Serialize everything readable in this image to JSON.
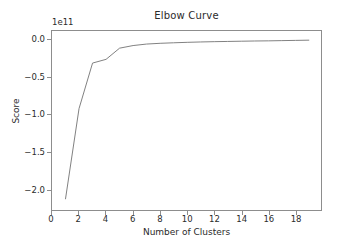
{
  "chart_data": {
    "type": "line",
    "title": "Elbow Curve",
    "xlabel": "Number of Clusters",
    "ylabel": "Score",
    "y_exponent_label": "1e11",
    "y_scale_factor": 100000000000.0,
    "grid": false,
    "legend": "none",
    "line_color": "#7f7f7f",
    "line_width": 1,
    "xlim": [
      0,
      19.9
    ],
    "ylim": [
      -2.28,
      0.12
    ],
    "xticks": [
      0,
      2,
      4,
      6,
      8,
      10,
      12,
      14,
      16,
      18
    ],
    "xtick_labels": [
      "0",
      "2",
      "4",
      "6",
      "8",
      "10",
      "12",
      "14",
      "16",
      "18"
    ],
    "yticks": [
      0.0,
      -0.5,
      -1.0,
      -1.5,
      -2.0
    ],
    "ytick_labels": [
      "0.0",
      "−0.5",
      "−1.0",
      "−1.5",
      "−2.0"
    ],
    "x": [
      1,
      2,
      3,
      4,
      5,
      6,
      7,
      8,
      9,
      10,
      11,
      12,
      13,
      14,
      15,
      16,
      17,
      18,
      19
    ],
    "values": [
      -2.13,
      -0.92,
      -0.31,
      -0.26,
      -0.11,
      -0.075,
      -0.055,
      -0.045,
      -0.038,
      -0.032,
      -0.027,
      -0.023,
      -0.02,
      -0.017,
      -0.014,
      -0.012,
      -0.009,
      -0.006,
      -0.003
    ],
    "series": [
      {
        "name": "Score",
        "values": [
          -2.13,
          -0.92,
          -0.31,
          -0.26,
          -0.11,
          -0.075,
          -0.055,
          -0.045,
          -0.038,
          -0.032,
          -0.027,
          -0.023,
          -0.02,
          -0.017,
          -0.014,
          -0.012,
          -0.009,
          -0.006,
          -0.003
        ]
      }
    ]
  }
}
